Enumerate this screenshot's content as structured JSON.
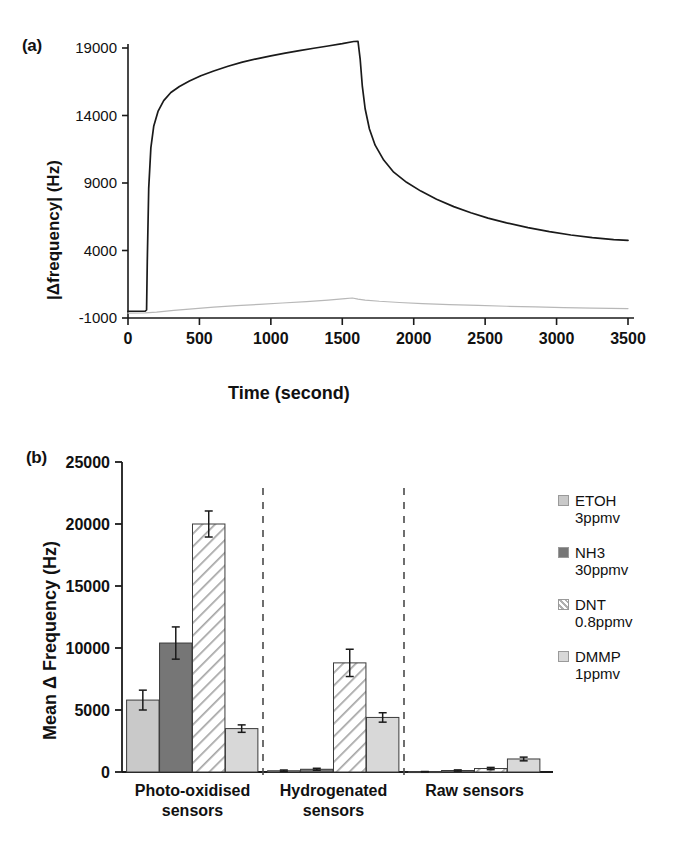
{
  "figure": {
    "panels": [
      "a",
      "b"
    ]
  },
  "panel_a": {
    "tag": "(a)",
    "ylabel": "|Δfrequency| (Hz)",
    "xlabel": "Time (second)",
    "yticks": [
      "19000",
      "14000",
      "9000",
      "4000",
      "-1000"
    ],
    "xticks": [
      "0",
      "500",
      "1000",
      "1500",
      "2000",
      "2500",
      "3000",
      "3500"
    ]
  },
  "panel_b": {
    "tag": "(b)",
    "ylabel": "Mean Δ Frequency (Hz)",
    "yticks": [
      "25000",
      "20000",
      "15000",
      "10000",
      "5000",
      "0"
    ],
    "categories": [
      {
        "line1": "Photo-oxidised",
        "line2": "sensors"
      },
      {
        "line1": "Hydrogenated",
        "line2": "sensors"
      },
      {
        "line1": "Raw sensors",
        "line2": ""
      }
    ],
    "legend": [
      {
        "name": "ETOH",
        "conc": "3ppmv",
        "color": "#c9c9c9",
        "pattern": "solid"
      },
      {
        "name": "NH3",
        "conc": "30ppmv",
        "color": "#767676",
        "pattern": "solid"
      },
      {
        "name": "DNT",
        "conc": "0.8ppmv",
        "color": "#ffffff",
        "pattern": "hatch"
      },
      {
        "name": "DMMP",
        "conc": "1ppmv",
        "color": "#d8d8d8",
        "pattern": "solid"
      }
    ]
  },
  "chart_data": [
    {
      "id": "panel-a-kinetics",
      "type": "line",
      "title": "",
      "xlabel": "Time (second)",
      "ylabel": "|Δfrequency| (Hz)",
      "xlim": [
        0,
        3500
      ],
      "ylim": [
        -1000,
        19000
      ],
      "xticks": [
        0,
        500,
        1000,
        1500,
        2000,
        2500,
        3000,
        3500
      ],
      "yticks": [
        -1000,
        4000,
        9000,
        14000,
        19000
      ],
      "grid": false,
      "legend_position": "none",
      "series": [
        {
          "name": "response-curve",
          "color": "#1a1a1a",
          "x": [
            0,
            60,
            120,
            130,
            135,
            145,
            160,
            180,
            210,
            250,
            300,
            360,
            430,
            510,
            600,
            700,
            800,
            900,
            1000,
            1100,
            1200,
            1300,
            1400,
            1500,
            1580,
            1610,
            1625,
            1640,
            1660,
            1690,
            1730,
            1790,
            1860,
            1950,
            2050,
            2160,
            2280,
            2400,
            2520,
            2650,
            2800,
            2950,
            3100,
            3250,
            3400,
            3500
          ],
          "y": [
            -500,
            -500,
            -500,
            -400,
            3200,
            8600,
            11600,
            13200,
            14300,
            15100,
            15700,
            16150,
            16550,
            16950,
            17300,
            17650,
            17950,
            18200,
            18420,
            18620,
            18800,
            18980,
            19150,
            19320,
            19480,
            19500,
            18200,
            16200,
            14500,
            13000,
            11800,
            10700,
            9800,
            9050,
            8400,
            7800,
            7250,
            6800,
            6400,
            6050,
            5700,
            5400,
            5150,
            4950,
            4800,
            4750
          ]
        },
        {
          "name": "reference-curve",
          "color": "#b8b8b8",
          "x": [
            0,
            120,
            200,
            320,
            450,
            600,
            760,
            920,
            1080,
            1250,
            1400,
            1520,
            1570,
            1610,
            1660,
            1760,
            1900,
            2060,
            2250,
            2450,
            2650,
            2850,
            3050,
            3250,
            3500
          ],
          "y": [
            -640,
            -620,
            -560,
            -440,
            -320,
            -200,
            -90,
            10,
            110,
            220,
            330,
            430,
            480,
            400,
            330,
            240,
            150,
            70,
            -10,
            -70,
            -130,
            -180,
            -230,
            -270,
            -300
          ]
        }
      ]
    },
    {
      "id": "panel-b-mean-response",
      "type": "bar",
      "title": "",
      "xlabel": "",
      "ylabel": "Mean Δ Frequency (Hz)",
      "ylim": [
        0,
        25000
      ],
      "yticks": [
        0,
        5000,
        10000,
        15000,
        20000,
        25000
      ],
      "grid": false,
      "legend_position": "right",
      "categories": [
        "Photo-oxidised sensors",
        "Hydrogenated sensors",
        "Raw sensors"
      ],
      "series": [
        {
          "name": "ETOH 3ppmv",
          "color": "#c9c9c9",
          "pattern": "solid",
          "values": [
            5800,
            100,
            20
          ],
          "errors": [
            800,
            60,
            20
          ]
        },
        {
          "name": "NH3 30ppmv",
          "color": "#767676",
          "pattern": "solid",
          "values": [
            10400,
            220,
            120
          ],
          "errors": [
            1300,
            80,
            50
          ]
        },
        {
          "name": "DNT 0.8ppmv",
          "color": "#ffffff",
          "pattern": "hatch",
          "values": [
            20000,
            8800,
            280
          ],
          "errors": [
            1050,
            1100,
            90
          ]
        },
        {
          "name": "DMMP 1ppmv",
          "color": "#d8d8d8",
          "pattern": "solid",
          "values": [
            3500,
            4400,
            1050
          ],
          "errors": [
            300,
            380,
            150
          ]
        }
      ],
      "separators": [
        1,
        2
      ]
    }
  ]
}
